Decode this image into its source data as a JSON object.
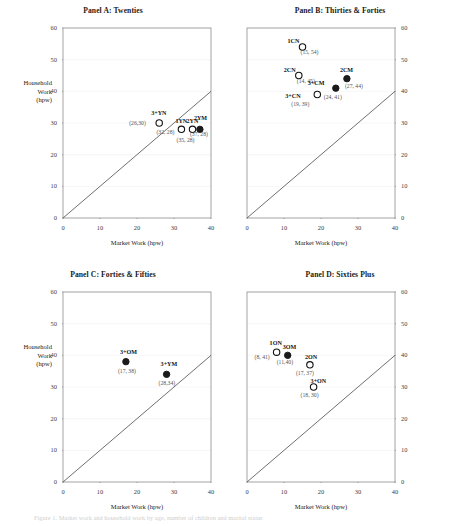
{
  "figure": {
    "caption": "Figure 1. Market work and household work by age, number of children and marital status"
  },
  "axes": {
    "ylabel_line1": "Household",
    "ylabel_line2": "Work",
    "ylabel_line3": "(hpw)",
    "xlabel": "Market Work (hpw)",
    "xticks": [
      "0",
      "10",
      "20",
      "30",
      "40"
    ],
    "yticks": [
      "0",
      "10",
      "20",
      "30",
      "40",
      "50",
      "60"
    ]
  },
  "chart_data": [
    {
      "type": "scatter",
      "title": "Panel A: Twenties",
      "xlabel": "Market Work (hpw)",
      "ylabel": "Household Work (hpw)",
      "xlim": [
        0,
        40
      ],
      "ylim": [
        0,
        60
      ],
      "grid": true,
      "legend": "none",
      "reference_line": "45-degree line y = x",
      "points": [
        {
          "label": "3+YN",
          "x": 26,
          "y": 30,
          "coord": "(26,30)",
          "marker": "open",
          "label_dx": -2,
          "label_dy": -10,
          "coord_dx": -24,
          "coord_dy": -1
        },
        {
          "label": "1YN",
          "x": 32,
          "y": 28,
          "coord": "(32, 28)",
          "marker": "open",
          "label_dx": 0,
          "label_dy": -8,
          "coord_dx": -19,
          "coord_dy": 2
        },
        {
          "label": "2YN",
          "x": 35,
          "y": 28,
          "coord": "(35, 28)",
          "marker": "open",
          "label_dx": 0,
          "label_dy": -8,
          "coord_dx": -10,
          "coord_dy": 10
        },
        {
          "label": "2YM",
          "x": 37,
          "y": 28,
          "coord": "(37, 28)",
          "marker": "filled",
          "label_dx": 0,
          "label_dy": -11,
          "coord_dx": -4,
          "coord_dy": 4
        }
      ]
    },
    {
      "type": "scatter",
      "title": "Panel B: Thirties & Forties",
      "xlabel": "Market Work (hpw)",
      "ylabel": "Household Work (hpw)",
      "xlim": [
        0,
        40
      ],
      "ylim": [
        0,
        60
      ],
      "grid": true,
      "legend": "none",
      "reference_line": "45-degree line y = x",
      "points": [
        {
          "label": "1CN",
          "x": 15,
          "y": 54,
          "coord": "(15, 54)",
          "marker": "open",
          "label_dx": -9,
          "label_dy": -6,
          "coord_dx": 4,
          "coord_dy": 4
        },
        {
          "label": "2CN",
          "x": 14,
          "y": 45,
          "coord": "(14, 45)",
          "marker": "open",
          "label_dx": -9,
          "label_dy": -6,
          "coord_dx": 4,
          "coord_dy": 4
        },
        {
          "label": "2CM",
          "x": 27,
          "y": 44,
          "coord": "(27, 44)",
          "marker": "filled",
          "label_dx": -1,
          "label_dy": -9,
          "coord_dx": 4,
          "coord_dy": 6
        },
        {
          "label": "3+CM",
          "x": 24,
          "y": 41,
          "coord": "(24, 41)",
          "marker": "filled",
          "label_dx": -22,
          "label_dy": -5,
          "coord_dx": -6,
          "coord_dy": 8
        },
        {
          "label": "3+CN",
          "x": 19,
          "y": 39,
          "coord": "(19, 39)",
          "marker": "open",
          "label_dx": -26,
          "label_dy": 1,
          "coord_dx": -20,
          "coord_dy": 8
        }
      ]
    },
    {
      "type": "scatter",
      "title": "Panel C: Forties & Fifties",
      "xlabel": "Market Work (hpw)",
      "ylabel": "Household Work (hpw)",
      "xlim": [
        0,
        40
      ],
      "ylim": [
        0,
        60
      ],
      "grid": true,
      "legend": "none",
      "reference_line": "45-degree line y = x",
      "points": [
        {
          "label": "3+OM",
          "x": 17,
          "y": 38,
          "coord": "(17, 38)",
          "marker": "filled",
          "label_dx": 0,
          "label_dy": -10,
          "coord_dx": -2,
          "coord_dy": 8
        },
        {
          "label": "3+YM",
          "x": 28,
          "y": 34,
          "coord": "(28,34)",
          "marker": "filled",
          "label_dx": 0,
          "label_dy": -10,
          "coord_dx": -2,
          "coord_dy": 8
        }
      ]
    },
    {
      "type": "scatter",
      "title": "Panel D: Sixties Plus",
      "xlabel": "Market Work (hpw)",
      "ylabel": "Household Work (hpw)",
      "xlim": [
        0,
        40
      ],
      "ylim": [
        0,
        60
      ],
      "grid": true,
      "legend": "none",
      "reference_line": "45-degree line y = x",
      "points": [
        {
          "label": "1ON",
          "x": 8,
          "y": 41,
          "coord": "(8, 41)",
          "marker": "open",
          "label_dx": -1,
          "label_dy": -9,
          "coord_dx": -16,
          "coord_dy": 4
        },
        {
          "label": "3OM",
          "x": 11,
          "y": 40,
          "coord": "(11,40)",
          "marker": "filled",
          "label_dx": 1,
          "label_dy": -8,
          "coord_dx": -5,
          "coord_dy": 6
        },
        {
          "label": "2ON",
          "x": 17,
          "y": 37,
          "coord": "(17, 37)",
          "marker": "open",
          "label_dx": 1,
          "label_dy": -8,
          "coord_dx": -8,
          "coord_dy": 7
        },
        {
          "label": "3+ON",
          "x": 18,
          "y": 30,
          "coord": "(18, 30)",
          "marker": "open",
          "label_dx": 3,
          "label_dy": -6,
          "coord_dx": -7,
          "coord_dy": 7
        }
      ]
    }
  ]
}
